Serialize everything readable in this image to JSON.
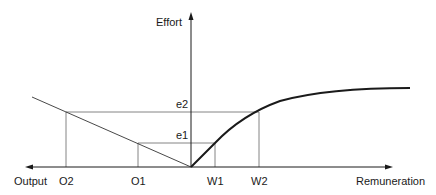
{
  "diagram": {
    "y_axis_label": "Effort",
    "x_axis_left_label": "Output",
    "x_axis_right_label": "Remuneration",
    "effort_levels": [
      "e1",
      "e2"
    ],
    "output_levels": [
      "O1",
      "O2"
    ],
    "remuneration_levels": [
      "W1",
      "W2"
    ],
    "colors": {
      "line": "#1a1a1a",
      "guide": "#555555"
    }
  }
}
